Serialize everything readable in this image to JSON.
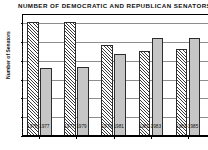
{
  "chart_data": {
    "type": "bar",
    "title": "NUMBER OF DEMOCRATIC AND REPUBLICAN SENATORS",
    "xlabel": "",
    "ylabel": "Number of Senators",
    "categories": [
      "1975-1977",
      "1977-1979",
      "1979-1981",
      "1981-1983",
      "1983-1985"
    ],
    "series": [
      {
        "name": "Democratic",
        "values": [
          61,
          61,
          49,
          45.5,
          46.5
        ],
        "pattern": "diagonal-hatch",
        "color": "#efefef"
      },
      {
        "name": "Republican",
        "values": [
          36.5,
          37,
          44,
          52.5,
          52.5
        ],
        "pattern": "solid",
        "color": "#c6c6c6"
      }
    ],
    "ylim": [
      0,
      60
    ],
    "yticks": [
      0,
      10,
      20,
      30,
      40,
      50,
      60
    ],
    "ytick_labels": [
      "0",
      "10",
      "20",
      "30",
      "40",
      "50",
      "60"
    ],
    "grid": true,
    "grid_axis": "y",
    "legend": "none",
    "note": "right edge of plot is cropped in the screenshot"
  },
  "colors": {
    "axis": "#000000",
    "gridline": "#8d8d8d",
    "democratic_fill": "#efefef",
    "republican_fill": "#c6c6c6",
    "bar_border": "#2c2c2c",
    "background": "#ffffff"
  }
}
